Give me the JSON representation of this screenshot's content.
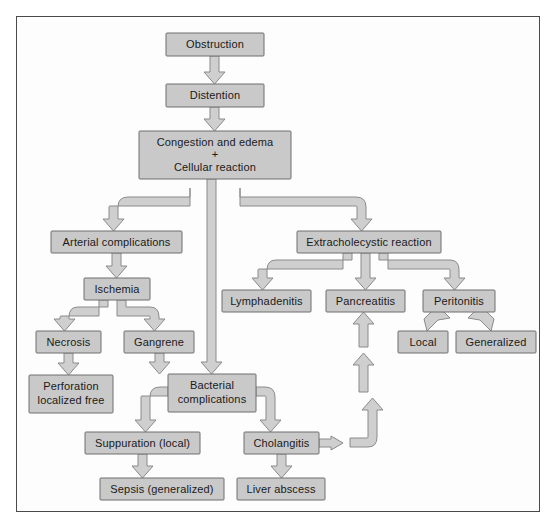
{
  "figure": {
    "type": "flowchart",
    "border_color": "#4a4a4a",
    "node_fill": "#c9c9c9",
    "node_border": "#6e6e6e",
    "arrow_fill": "#cfcfcf",
    "arrow_border": "#8a8a8a",
    "background": "#ffffff"
  },
  "nodes": {
    "obstruction": {
      "label": "Obstruction",
      "x": 166,
      "y": 33,
      "w": 98,
      "h": 23
    },
    "distention": {
      "label": "Distention",
      "x": 166,
      "y": 84,
      "w": 98,
      "h": 23
    },
    "congestion": {
      "label_line1": "Congestion and edema",
      "label_line2": "+",
      "label_line3": "Cellular reaction",
      "x": 139,
      "y": 131,
      "w": 152,
      "h": 48
    },
    "arterial_complications": {
      "label": "Arterial complications",
      "x": 51,
      "y": 231,
      "w": 131,
      "h": 22
    },
    "extracholecystic_reaction": {
      "label": "Extracholecystic reaction",
      "x": 297,
      "y": 231,
      "w": 144,
      "h": 22
    },
    "ischemia": {
      "label": "Ischemia",
      "x": 84,
      "y": 278,
      "w": 66,
      "h": 22
    },
    "lymphadenitis": {
      "label": "Lymphadenitis",
      "x": 222,
      "y": 290,
      "w": 89,
      "h": 22
    },
    "pancreatitis": {
      "label": "Pancreatitis",
      "x": 326,
      "y": 290,
      "w": 79,
      "h": 22
    },
    "peritonitis": {
      "label": "Peritonitis",
      "x": 423,
      "y": 290,
      "w": 72,
      "h": 22
    },
    "necrosis": {
      "label": "Necrosis",
      "x": 36,
      "y": 331,
      "w": 65,
      "h": 22
    },
    "gangrene": {
      "label": "Gangrene",
      "x": 124,
      "y": 331,
      "w": 70,
      "h": 22
    },
    "local": {
      "label": "Local",
      "x": 398,
      "y": 331,
      "w": 50,
      "h": 22
    },
    "generalized": {
      "label": "Generalized",
      "x": 456,
      "y": 331,
      "w": 80,
      "h": 22
    },
    "perforation": {
      "label_line1": "Perforation",
      "label_line2": "localized free",
      "x": 29,
      "y": 375,
      "w": 84,
      "h": 38
    },
    "bacterial_complications": {
      "label_line1": "Bacterial",
      "label_line2": "complications",
      "x": 168,
      "y": 374,
      "w": 88,
      "h": 38
    },
    "suppuration": {
      "label": "Suppuration (local)",
      "x": 85,
      "y": 432,
      "w": 115,
      "h": 22
    },
    "cholangitis": {
      "label": "Cholangitis",
      "x": 244,
      "y": 432,
      "w": 75,
      "h": 22
    },
    "sepsis": {
      "label": "Sepsis (generalized)",
      "x": 100,
      "y": 478,
      "w": 124,
      "h": 22
    },
    "liver_abscess": {
      "label": "Liver abscess",
      "x": 237,
      "y": 478,
      "w": 88,
      "h": 22
    }
  },
  "edges": [
    {
      "from": "obstruction",
      "to": "distention",
      "kind": "straight-down"
    },
    {
      "from": "distention",
      "to": "congestion",
      "kind": "straight-down"
    },
    {
      "from": "congestion",
      "to": "arterial_complications",
      "kind": "elbow-left"
    },
    {
      "from": "congestion",
      "to": "extracholecystic_reaction",
      "kind": "elbow-right"
    },
    {
      "from": "congestion",
      "to": "bacterial_complications",
      "kind": "long-straight-down"
    },
    {
      "from": "arterial_complications",
      "to": "ischemia",
      "kind": "straight-down"
    },
    {
      "from": "ischemia",
      "to": "necrosis",
      "kind": "elbow-left"
    },
    {
      "from": "ischemia",
      "to": "gangrene",
      "kind": "elbow-right"
    },
    {
      "from": "necrosis",
      "to": "perforation",
      "kind": "straight-down"
    },
    {
      "from": "gangrene",
      "to": "bacterial_complications",
      "kind": "straight-down"
    },
    {
      "from": "extracholecystic_reaction",
      "to": "lymphadenitis",
      "kind": "elbow-left"
    },
    {
      "from": "extracholecystic_reaction",
      "to": "pancreatitis",
      "kind": "straight-down"
    },
    {
      "from": "extracholecystic_reaction",
      "to": "peritonitis",
      "kind": "elbow-right"
    },
    {
      "from": "peritonitis",
      "to": "local",
      "kind": "elbow-left"
    },
    {
      "from": "peritonitis",
      "to": "generalized",
      "kind": "elbow-right"
    },
    {
      "from": "bacterial_complications",
      "to": "suppuration",
      "kind": "elbow-left"
    },
    {
      "from": "bacterial_complications",
      "to": "cholangitis",
      "kind": "elbow-right"
    },
    {
      "from": "suppuration",
      "to": "sepsis",
      "kind": "straight-down"
    },
    {
      "from": "cholangitis",
      "to": "liver_abscess",
      "kind": "straight-down"
    },
    {
      "from": "cholangitis",
      "to": "pancreatitis",
      "kind": "feedback-up-right"
    }
  ]
}
